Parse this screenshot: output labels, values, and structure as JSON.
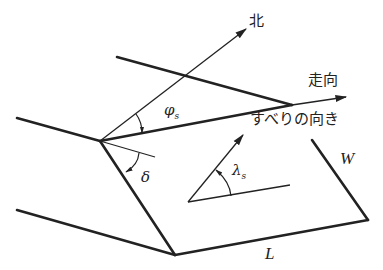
{
  "diagram": {
    "labels": {
      "north": "北",
      "strike": "走向",
      "slip_direction": "すべりの向き",
      "width": "W",
      "length": "L",
      "strike_angle_symbol": "φ",
      "strike_angle_sub": "s",
      "dip_angle_symbol": "δ",
      "rake_angle_symbol": "λ",
      "rake_angle_sub": "s"
    },
    "colors": {
      "line": "#222222",
      "background": "#ffffff"
    }
  }
}
